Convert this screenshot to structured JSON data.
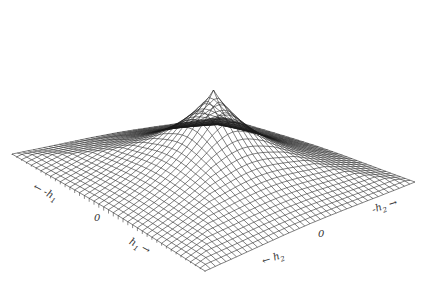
{
  "chart_data": {
    "type": "surface-wireframe",
    "title": "",
    "axes": {
      "h1": {
        "label": "h1",
        "ticks": [
          "-h1",
          "0",
          "h1"
        ]
      },
      "h2": {
        "label": "h2",
        "ticks": [
          "-h2",
          "0",
          "h2"
        ]
      },
      "z": {
        "label": "",
        "ticks": []
      }
    },
    "grid_lines": 40,
    "peak": {
      "h1": 0,
      "h2": 0,
      "relative_height": 1.0
    },
    "line_color": "#1a1a1a",
    "background": "#ffffff"
  },
  "labels": {
    "h1_neg": "h",
    "h1_neg_prefix": "-",
    "h1_sub": "1",
    "h1_zero": "0",
    "h1_pos": "h",
    "h2_neg": "h",
    "h2_neg_prefix": "-",
    "h2_sub": "2",
    "h2_zero": "0",
    "h2_pos": "h"
  }
}
